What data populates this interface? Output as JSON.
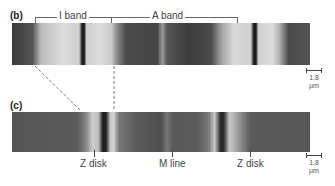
{
  "figure": {
    "panel_b": {
      "label": "(b)",
      "bands": [
        {
          "name": "I band"
        },
        {
          "name": "A band"
        }
      ],
      "scale_value": "1.8",
      "scale_unit": "µm"
    },
    "panel_c": {
      "label": "(c)",
      "annotations": [
        {
          "name": "Z disk"
        },
        {
          "name": "M line"
        },
        {
          "name": "Z disk"
        }
      ],
      "scale_value": "1.8",
      "scale_unit": "µm"
    },
    "colors": {
      "dark_band": "#3a3a3a",
      "light_band": "#d8d8d8",
      "line": "#666666"
    }
  }
}
